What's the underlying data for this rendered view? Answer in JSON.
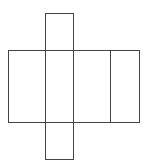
{
  "diagram": {
    "type": "cuboid-net",
    "stroke": "#444444",
    "background": "#ffffff",
    "faces": [
      {
        "name": "top-face",
        "x": 45,
        "y": 13,
        "w": 28,
        "h": 37
      },
      {
        "name": "left-face",
        "x": 8,
        "y": 50,
        "w": 37,
        "h": 72
      },
      {
        "name": "front-face",
        "x": 45,
        "y": 50,
        "w": 28,
        "h": 72
      },
      {
        "name": "right-face",
        "x": 73,
        "y": 50,
        "w": 37,
        "h": 72
      },
      {
        "name": "back-face",
        "x": 110,
        "y": 50,
        "w": 29,
        "h": 72
      },
      {
        "name": "bottom-face",
        "x": 45,
        "y": 122,
        "w": 28,
        "h": 37
      }
    ]
  }
}
